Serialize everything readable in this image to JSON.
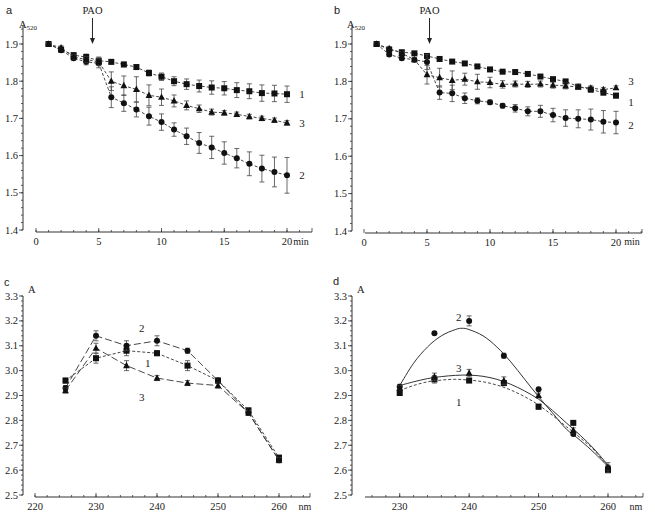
{
  "chart_data": [
    {
      "panel": "a",
      "type": "line",
      "title": "",
      "ylabel": "A520",
      "ylabel_main": "A",
      "ylabel_sub": "520",
      "xlabel": "min",
      "xlim": [
        0,
        22
      ],
      "ylim": [
        1.4,
        1.95
      ],
      "xticks": [
        0,
        5,
        10,
        15,
        20
      ],
      "yticks": [
        1.4,
        1.5,
        1.6,
        1.7,
        1.8,
        1.9
      ],
      "ytick_labels": [
        "1.4",
        "1.5",
        "1.6",
        "1.7",
        "1.8",
        "1.9"
      ],
      "grid": false,
      "annotation": {
        "text": "PAO",
        "x": 4.5,
        "arrow": true
      },
      "x": [
        1,
        2,
        3,
        4,
        5,
        6,
        7,
        8,
        9,
        10,
        11,
        12,
        13,
        14,
        15,
        16,
        17,
        18,
        19,
        20
      ],
      "series": [
        {
          "name": "1",
          "marker": "square",
          "line": "dashed",
          "values": [
            1.9,
            1.885,
            1.87,
            1.865,
            1.855,
            1.852,
            1.845,
            1.838,
            1.822,
            1.812,
            1.8,
            1.792,
            1.787,
            1.783,
            1.781,
            1.776,
            1.773,
            1.768,
            1.767,
            1.765
          ],
          "errors": [
            0.003,
            0.005,
            0.006,
            0.008,
            0.01,
            0.006,
            0.006,
            0.006,
            0.008,
            0.01,
            0.012,
            0.014,
            0.016,
            0.018,
            0.018,
            0.02,
            0.02,
            0.022,
            0.022,
            0.022
          ],
          "label_pos": {
            "x": 21.2,
            "y": 1.765
          }
        },
        {
          "name": "2",
          "marker": "circle",
          "line": "dashed",
          "values": [
            1.9,
            1.883,
            1.862,
            1.852,
            1.848,
            1.757,
            1.741,
            1.724,
            1.706,
            1.69,
            1.67,
            1.652,
            1.634,
            1.622,
            1.607,
            1.593,
            1.578,
            1.565,
            1.556,
            1.547
          ],
          "errors": [
            0.003,
            0.005,
            0.006,
            0.008,
            0.012,
            0.028,
            0.022,
            0.02,
            0.024,
            0.022,
            0.018,
            0.022,
            0.028,
            0.03,
            0.03,
            0.026,
            0.032,
            0.036,
            0.04,
            0.048
          ],
          "label_pos": {
            "x": 21.2,
            "y": 1.547
          }
        },
        {
          "name": "3",
          "marker": "triangle",
          "line": "dashed",
          "values": [
            1.9,
            1.89,
            1.865,
            1.858,
            1.852,
            1.8,
            1.788,
            1.778,
            1.762,
            1.757,
            1.747,
            1.735,
            1.726,
            1.717,
            1.715,
            1.711,
            1.705,
            1.7,
            1.695,
            1.688
          ],
          "errors": [
            0.003,
            0.005,
            0.006,
            0.008,
            0.01,
            0.025,
            0.026,
            0.034,
            0.028,
            0.022,
            0.016,
            0.012,
            0.01,
            0.008,
            0.006,
            0.006,
            0.006,
            0.006,
            0.006,
            0.006
          ],
          "label_pos": {
            "x": 21.2,
            "y": 1.688
          }
        }
      ]
    },
    {
      "panel": "b",
      "type": "line",
      "title": "",
      "ylabel": "A520",
      "ylabel_main": "A",
      "ylabel_sub": "520",
      "xlabel": "min",
      "xlim": [
        0,
        22
      ],
      "ylim": [
        1.4,
        1.95
      ],
      "xticks": [
        0,
        5,
        10,
        15,
        20
      ],
      "yticks": [
        1.4,
        1.5,
        1.6,
        1.7,
        1.8,
        1.9
      ],
      "ytick_labels": [
        "1.4",
        "1.5",
        "1.6",
        "1.7",
        "1.8",
        "1.9"
      ],
      "grid": false,
      "annotation": {
        "text": "PAO",
        "x": 5.2,
        "arrow": true
      },
      "x": [
        1,
        2,
        3,
        4,
        5,
        6,
        7,
        8,
        9,
        10,
        11,
        12,
        13,
        14,
        15,
        16,
        17,
        18,
        19,
        20
      ],
      "series": [
        {
          "name": "1",
          "marker": "square",
          "line": "dashed",
          "values": [
            1.9,
            1.885,
            1.878,
            1.875,
            1.868,
            1.86,
            1.853,
            1.848,
            1.84,
            1.832,
            1.826,
            1.825,
            1.82,
            1.813,
            1.806,
            1.8,
            1.786,
            1.778,
            1.77,
            1.762
          ],
          "errors": [
            0.003,
            0.004,
            0.004,
            0.004,
            0.005,
            0.004,
            0.004,
            0.004,
            0.004,
            0.004,
            0.004,
            0.004,
            0.004,
            0.004,
            0.004,
            0.004,
            0.005,
            0.006,
            0.006,
            0.006
          ],
          "label_pos": {
            "x": 21.2,
            "y": 1.745
          }
        },
        {
          "name": "2",
          "marker": "circle",
          "line": "dashed",
          "values": [
            1.9,
            1.872,
            1.862,
            1.858,
            1.852,
            1.77,
            1.768,
            1.755,
            1.748,
            1.744,
            1.735,
            1.728,
            1.72,
            1.72,
            1.71,
            1.702,
            1.7,
            1.698,
            1.692,
            1.69
          ],
          "errors": [
            0.003,
            0.005,
            0.005,
            0.005,
            0.02,
            0.018,
            0.022,
            0.014,
            0.008,
            0.006,
            0.006,
            0.01,
            0.012,
            0.016,
            0.018,
            0.022,
            0.024,
            0.028,
            0.03,
            0.03
          ],
          "label_pos": {
            "x": 21.2,
            "y": 1.683
          }
        },
        {
          "name": "3",
          "marker": "triangle",
          "line": "dashed",
          "values": [
            1.9,
            1.888,
            1.875,
            1.858,
            1.818,
            1.81,
            1.803,
            1.806,
            1.799,
            1.797,
            1.792,
            1.793,
            1.792,
            1.793,
            1.79,
            1.788,
            1.785,
            1.782,
            1.778,
            1.783
          ],
          "errors": [
            0.003,
            0.005,
            0.005,
            0.006,
            0.025,
            0.025,
            0.025,
            0.016,
            0.02,
            0.014,
            0.01,
            0.008,
            0.008,
            0.008,
            0.008,
            0.008,
            0.006,
            0.006,
            0.006,
            0.005
          ],
          "label_pos": {
            "x": 21.2,
            "y": 1.8
          }
        }
      ]
    },
    {
      "panel": "c",
      "type": "line",
      "title": "",
      "ylabel": "A",
      "ylabel_main": "A",
      "ylabel_sub": "",
      "xlabel": "nm",
      "xlim": [
        220,
        265
      ],
      "ylim": [
        2.5,
        3.3
      ],
      "xticks": [
        220,
        230,
        240,
        250,
        260
      ],
      "yticks": [
        2.5,
        2.6,
        2.7,
        2.8,
        2.9,
        3.0,
        3.1,
        3.2,
        3.3
      ],
      "ytick_labels": [
        "2.5",
        "2.6",
        "2.7",
        "2.8",
        "2.9",
        "3.0",
        "3.1",
        "3.2",
        "3.3"
      ],
      "grid": false,
      "x": [
        225,
        230,
        235,
        240,
        245,
        250,
        255,
        260
      ],
      "series": [
        {
          "name": "1",
          "marker": "square",
          "line": "dashed",
          "values": [
            2.96,
            3.05,
            3.08,
            3.07,
            3.02,
            2.96,
            2.84,
            2.65
          ],
          "errors": [
            0.01,
            0.02,
            0.02,
            0.01,
            0.02,
            0.01,
            0.01,
            0.01
          ],
          "label_pos": {
            "x": 238.5,
            "y": 3.03
          }
        },
        {
          "name": "2",
          "marker": "circle",
          "line": "longdash",
          "values": [
            2.93,
            3.14,
            3.1,
            3.12,
            3.08,
            2.96,
            2.83,
            2.64
          ],
          "errors": [
            0.01,
            0.02,
            0.02,
            0.02,
            0.01,
            0.01,
            0.01,
            0.01
          ],
          "label_pos": {
            "x": 237.5,
            "y": 3.17
          }
        },
        {
          "name": "3",
          "marker": "triangle",
          "line": "longdash",
          "values": [
            2.92,
            3.09,
            3.02,
            2.97,
            2.95,
            2.94,
            2.83,
            2.64
          ],
          "errors": [
            0.01,
            0.02,
            0.02,
            0.01,
            0.01,
            0.01,
            0.01,
            0.01
          ],
          "label_pos": {
            "x": 237.5,
            "y": 2.895
          }
        }
      ]
    },
    {
      "panel": "d",
      "type": "line",
      "title": "",
      "ylabel": "A",
      "ylabel_main": "A",
      "ylabel_sub": "",
      "xlabel": "nm",
      "xlim": [
        225,
        265
      ],
      "ylim": [
        2.5,
        3.3
      ],
      "xticks": [
        230,
        240,
        250,
        260
      ],
      "yticks": [
        2.5,
        2.6,
        2.7,
        2.8,
        2.9,
        3.0,
        3.1,
        3.2,
        3.3
      ],
      "ytick_labels": [
        "2.5",
        "2.6",
        "2.7",
        "2.8",
        "2.9",
        "3.0",
        "3.1",
        "3.2",
        "3.3"
      ],
      "grid": false,
      "x": [
        230,
        235,
        240,
        245,
        250,
        255,
        260
      ],
      "series": [
        {
          "name": "1",
          "marker": "square",
          "line": "dashed-fit",
          "values": [
            2.91,
            2.965,
            2.96,
            2.95,
            2.855,
            2.79,
            2.6
          ],
          "errors": [
            0.01,
            0.015,
            0.005,
            0.01,
            0.01,
            0.005,
            0.01
          ],
          "fit": [
            [
              230,
              2.92
            ],
            [
              232,
              2.94
            ],
            [
              234,
              2.955
            ],
            [
              236,
              2.962
            ],
            [
              238,
              2.965
            ],
            [
              240,
              2.962
            ],
            [
              242,
              2.955
            ],
            [
              244,
              2.942
            ],
            [
              246,
              2.922
            ],
            [
              248,
              2.895
            ],
            [
              250,
              2.862
            ],
            [
              252,
              2.82
            ],
            [
              254,
              2.775
            ],
            [
              256,
              2.73
            ],
            [
              258,
              2.68
            ],
            [
              260,
              2.615
            ]
          ],
          "label_pos": {
            "x": 238.5,
            "y": 2.875
          }
        },
        {
          "name": "2",
          "marker": "circle",
          "line": "solid-fit",
          "values": [
            2.935,
            3.15,
            3.2,
            3.06,
            2.925,
            2.745,
            2.61
          ],
          "errors": [
            0.01,
            0.0,
            0.02,
            0.01,
            0.0,
            0.0,
            0.02
          ],
          "fit": [
            [
              230,
              2.94
            ],
            [
              232,
              3.03
            ],
            [
              234,
              3.095
            ],
            [
              236,
              3.14
            ],
            [
              238,
              3.165
            ],
            [
              239,
              3.17
            ],
            [
              240,
              3.165
            ],
            [
              242,
              3.14
            ],
            [
              244,
              3.095
            ],
            [
              246,
              3.035
            ],
            [
              248,
              2.965
            ],
            [
              250,
              2.895
            ],
            [
              252,
              2.83
            ],
            [
              254,
              2.765
            ],
            [
              256,
              2.72
            ],
            [
              258,
              2.67
            ],
            [
              260,
              2.615
            ]
          ],
          "label_pos": {
            "x": 238.5,
            "y": 3.215
          }
        },
        {
          "name": "3",
          "marker": "triangle",
          "line": "solid-fit",
          "values": [
            2.93,
            2.975,
            2.99,
            2.96,
            2.9,
            2.76,
            2.61
          ],
          "errors": [
            0.01,
            0.015,
            0.015,
            0.015,
            0.01,
            0.01,
            0.01
          ],
          "fit": [
            [
              230,
              2.94
            ],
            [
              232,
              2.955
            ],
            [
              234,
              2.968
            ],
            [
              236,
              2.976
            ],
            [
              238,
              2.981
            ],
            [
              240,
              2.982
            ],
            [
              242,
              2.977
            ],
            [
              244,
              2.965
            ],
            [
              246,
              2.945
            ],
            [
              248,
              2.918
            ],
            [
              250,
              2.885
            ],
            [
              252,
              2.84
            ],
            [
              254,
              2.79
            ],
            [
              256,
              2.74
            ],
            [
              258,
              2.685
            ],
            [
              260,
              2.62
            ]
          ],
          "label_pos": {
            "x": 238.5,
            "y": 3.01
          }
        }
      ]
    }
  ],
  "panels": [
    {
      "letter": "a",
      "ylabel_main": "A",
      "ylabel_sub": "520",
      "xunit": "min",
      "annotation": "PAO"
    },
    {
      "letter": "b",
      "ylabel_main": "A",
      "ylabel_sub": "520",
      "xunit": "min",
      "annotation": "PAO"
    },
    {
      "letter": "c",
      "ylabel_main": "A",
      "ylabel_sub": "",
      "xunit": "nm",
      "annotation": ""
    },
    {
      "letter": "d",
      "ylabel_main": "A",
      "ylabel_sub": "",
      "xunit": "nm",
      "annotation": ""
    }
  ]
}
